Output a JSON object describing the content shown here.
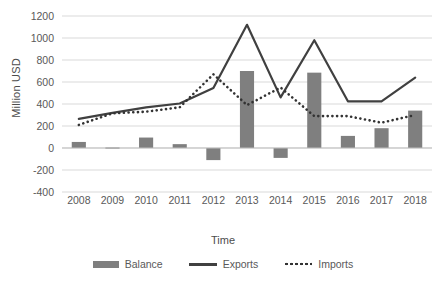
{
  "chart_data": {
    "type": "bar",
    "title": "",
    "xlabel": "Time",
    "ylabel": "Million USD",
    "categories": [
      "2008",
      "2009",
      "2010",
      "2011",
      "2012",
      "2013",
      "2014",
      "2015",
      "2016",
      "2017",
      "2018"
    ],
    "ylim": [
      -400,
      1200
    ],
    "ytick_values": [
      1200,
      1000,
      800,
      600,
      400,
      200,
      0,
      -200,
      -400
    ],
    "ytick_labels": [
      "1200",
      "1000",
      "800",
      "600",
      "400",
      "200",
      "0",
      "-200",
      "-400"
    ],
    "grid": true,
    "legend_position": "bottom",
    "series": [
      {
        "name": "Balance",
        "render": "bar",
        "color": "#7f7f7f",
        "values": [
          55,
          5,
          95,
          35,
          -110,
          700,
          -90,
          685,
          110,
          180,
          340
        ]
      },
      {
        "name": "Exports",
        "render": "line",
        "color": "#404040",
        "values": [
          265,
          320,
          370,
          405,
          545,
          1120,
          460,
          980,
          425,
          425,
          640
        ]
      },
      {
        "name": "Imports",
        "render": "dotted-line",
        "color": "#333333",
        "values": [
          210,
          315,
          330,
          370,
          670,
          390,
          550,
          290,
          290,
          230,
          300
        ]
      }
    ]
  },
  "legend": {
    "items": [
      {
        "label": "Balance",
        "marker": "bar-swatch-icon"
      },
      {
        "label": "Exports",
        "marker": "solid-line-swatch-icon"
      },
      {
        "label": "Imports",
        "marker": "dotted-line-swatch-icon"
      }
    ]
  }
}
